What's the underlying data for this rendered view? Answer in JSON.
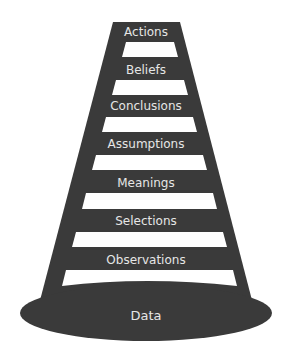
{
  "diagram": {
    "type": "ladder-of-inference",
    "colors": {
      "ladder": "#3a3a3a",
      "rung_gap": "#ffffff",
      "text": "#e6e6e6",
      "background": "#ffffff"
    },
    "rungs": [
      {
        "label": "Actions"
      },
      {
        "label": "Beliefs"
      },
      {
        "label": "Conclusions"
      },
      {
        "label": "Assumptions"
      },
      {
        "label": "Meanings"
      },
      {
        "label": "Selections"
      },
      {
        "label": "Observations"
      }
    ],
    "base": {
      "label": "Data"
    }
  }
}
